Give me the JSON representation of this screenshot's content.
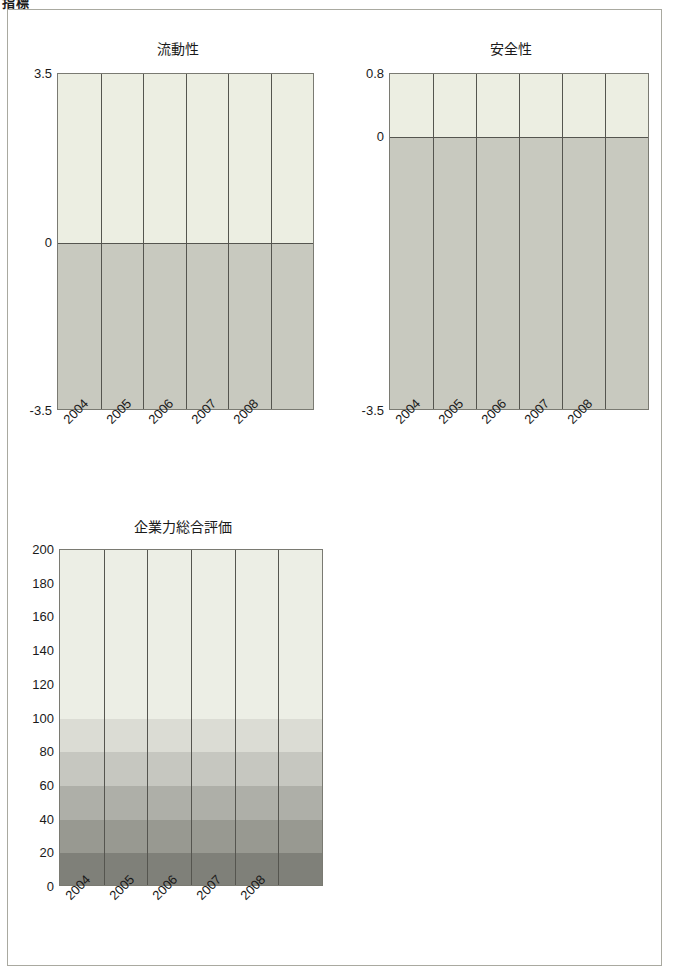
{
  "page": {
    "heading": "指標",
    "frame_border_color": "#a9a9a0",
    "background": "#ffffff"
  },
  "chart_data": [
    {
      "id": "liquidity",
      "type": "bar",
      "title": "流動性",
      "xlabel": "",
      "ylabel": "",
      "categories": [
        "2004",
        "2005",
        "2006",
        "2007",
        "2008"
      ],
      "values": [
        0,
        0,
        0,
        0,
        0
      ],
      "ylim": [
        -3.5,
        3.5
      ],
      "yticks": [
        "3.5",
        "0",
        "-3.5"
      ],
      "grid": false,
      "legend": "none",
      "bands": [
        {
          "from": 0,
          "to": 3.5,
          "color": "#eceee2"
        },
        {
          "from": -3.5,
          "to": 0,
          "color": "#c8c9bf"
        }
      ]
    },
    {
      "id": "safety",
      "type": "bar",
      "title": "安全性",
      "xlabel": "",
      "ylabel": "",
      "categories": [
        "2004",
        "2005",
        "2006",
        "2007",
        "2008"
      ],
      "values": [
        0,
        0,
        0,
        0,
        0
      ],
      "ylim": [
        -3.5,
        0.8
      ],
      "yticks": [
        "0.8",
        "0",
        "-3.5"
      ],
      "grid": false,
      "legend": "none",
      "bands": [
        {
          "from": 0,
          "to": 0.8,
          "color": "#eceee2"
        },
        {
          "from": -3.5,
          "to": 0,
          "color": "#c8c9bf"
        }
      ]
    },
    {
      "id": "overall-corporate-strength",
      "type": "bar",
      "title": "企業力総合評価",
      "xlabel": "",
      "ylabel": "",
      "categories": [
        "2004",
        "2005",
        "2006",
        "2007",
        "2008"
      ],
      "values": [
        0,
        0,
        0,
        0,
        0
      ],
      "ylim": [
        0,
        200
      ],
      "yticks": [
        "200",
        "180",
        "160",
        "140",
        "120",
        "100",
        "80",
        "60",
        "40",
        "20",
        "0"
      ],
      "grid": false,
      "legend": "none",
      "bands": [
        {
          "from": 100,
          "to": 200,
          "color": "#eceee5"
        },
        {
          "from": 80,
          "to": 100,
          "color": "#dbdcd4"
        },
        {
          "from": 60,
          "to": 80,
          "color": "#c6c7c0"
        },
        {
          "from": 40,
          "to": 60,
          "color": "#aeafa8"
        },
        {
          "from": 20,
          "to": 40,
          "color": "#989991"
        },
        {
          "from": 0,
          "to": 20,
          "color": "#7f8079"
        }
      ]
    }
  ]
}
